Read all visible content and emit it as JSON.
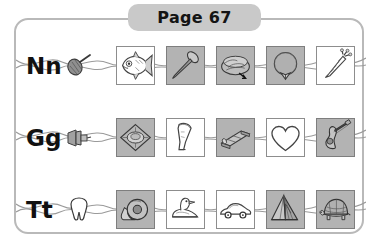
{
  "worksheet": {
    "header": {
      "tab_label": "Page 67",
      "page_number": "67"
    },
    "frame_color": "#b9b9b9",
    "tab_color": "#c9c9c9",
    "shaded_tile_color": "#b3b3b3",
    "plain_tile_color": "#ffffff",
    "rows": [
      {
        "letter": "Nn",
        "key_icon": "net-icon",
        "tiles": [
          {
            "name": "fish-picture",
            "label": "fish",
            "shaded": false
          },
          {
            "name": "nail-picture",
            "label": "nail",
            "shaded": true
          },
          {
            "name": "nest-picture",
            "label": "nest",
            "shaded": true
          },
          {
            "name": "necklace-picture",
            "label": "necklace",
            "shaded": true
          },
          {
            "name": "carrot-picture",
            "label": "carrot",
            "shaded": false
          }
        ]
      },
      {
        "letter": "Gg",
        "key_icon": "guitar-icon",
        "tiles": [
          {
            "name": "gem-picture",
            "label": "gem",
            "shaded": true
          },
          {
            "name": "funnel-picture",
            "label": "funnel",
            "shaded": false
          },
          {
            "name": "gate-picture",
            "label": "gate",
            "shaded": true
          },
          {
            "name": "heart-picture",
            "label": "heart",
            "shaded": false
          },
          {
            "name": "guitar-picture",
            "label": "guitar",
            "shaded": true
          }
        ]
      },
      {
        "letter": "Tt",
        "key_icon": "tooth-icon",
        "tiles": [
          {
            "name": "tape-picture",
            "label": "tape",
            "shaded": true
          },
          {
            "name": "duck-picture",
            "label": "duck",
            "shaded": false
          },
          {
            "name": "car-picture",
            "label": "car",
            "shaded": false
          },
          {
            "name": "tent-picture",
            "label": "tent",
            "shaded": true
          },
          {
            "name": "turtle-picture",
            "label": "turtle",
            "shaded": true
          }
        ]
      }
    ]
  }
}
